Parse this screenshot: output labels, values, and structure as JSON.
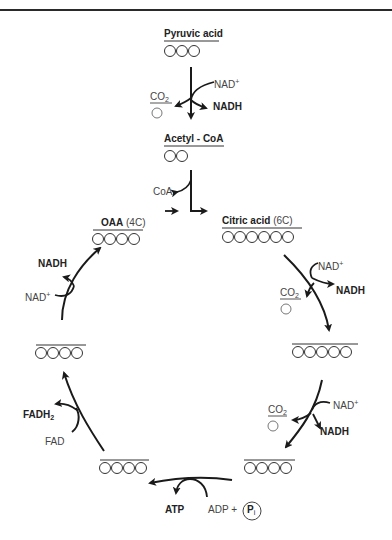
{
  "diagram": {
    "compounds": {
      "pyruvic_acid": {
        "name": "Pyruvic acid",
        "carbons": 3
      },
      "acetyl_coa": {
        "name": "Acetyl - CoA",
        "carbons": 2
      },
      "citric_acid": {
        "name": "Citric acid",
        "carbon_label": "(6C)",
        "carbons": 6
      },
      "five_carbon": {
        "name": "",
        "carbons": 5
      },
      "four_carbon_right": {
        "name": "",
        "carbons": 4
      },
      "four_carbon_bottom": {
        "name": "",
        "carbons": 4
      },
      "four_carbon_left": {
        "name": "",
        "carbons": 4
      },
      "oaa": {
        "name": "OAA",
        "carbon_label": "(4C)",
        "carbons": 4
      }
    },
    "cofactors": {
      "nad_plus": "NAD",
      "plus_sign": "+",
      "nadh": "NADH",
      "co2": "CO",
      "co2_sub": "2",
      "coa": "CoA",
      "fad": "FAD",
      "fadh2": "FADH",
      "fadh2_sub": "2",
      "atp": "ATP",
      "adp_plus": "ADP +",
      "pi": "P",
      "pi_sub": "i"
    }
  }
}
